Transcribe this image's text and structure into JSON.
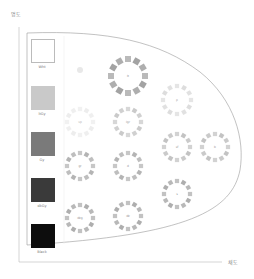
{
  "axes": {
    "y_label": "명도",
    "x_label": "채도"
  },
  "swatches": [
    {
      "label": "Wht",
      "color": "#ffffff",
      "border": "#bbbbbb",
      "top": 39
    },
    {
      "label": "ltGy",
      "color": "#c9c9c9",
      "border": "#c9c9c9",
      "top": 86
    },
    {
      "label": "Gy",
      "color": "#7a7a7a",
      "border": "#7a7a7a",
      "top": 132
    },
    {
      "label": "dkGy",
      "color": "#3a3a3a",
      "border": "#3a3a3a",
      "top": 178
    },
    {
      "label": "Black",
      "color": "#0d0d0d",
      "border": "#0d0d0d",
      "top": 224
    }
  ],
  "tone_rings": [
    {
      "label": "ltgy",
      "cx": 80,
      "cy": 70,
      "r": 3,
      "shade": "#d8d8d8",
      "opacity": 0.6
    },
    {
      "label": "lt",
      "cx": 128,
      "cy": 76,
      "r": 17,
      "shade": "#9a9a9a",
      "opacity": 0.9
    },
    {
      "label": "p",
      "cx": 177,
      "cy": 100,
      "r": 14,
      "shade": "#cfcfcf",
      "opacity": 0.7
    },
    {
      "label": "vp",
      "cx": 80,
      "cy": 122,
      "r": 13,
      "shade": "#e2e2e2",
      "opacity": 0.6
    },
    {
      "label": "lgr",
      "cx": 128,
      "cy": 122,
      "r": 13,
      "shade": "#bdbdbd",
      "opacity": 0.8
    },
    {
      "label": "sf",
      "cx": 177,
      "cy": 147,
      "r": 13,
      "shade": "#b5b5b5",
      "opacity": 0.8
    },
    {
      "label": "b",
      "cx": 215,
      "cy": 147,
      "r": 13,
      "shade": "#b5b5b5",
      "opacity": 0.8
    },
    {
      "label": "gr",
      "cx": 80,
      "cy": 166,
      "r": 13,
      "shade": "#a8a8a8",
      "opacity": 0.85
    },
    {
      "label": "d",
      "cx": 128,
      "cy": 166,
      "r": 13,
      "shade": "#a8a8a8",
      "opacity": 0.85
    },
    {
      "label": "s",
      "cx": 177,
      "cy": 194,
      "r": 13,
      "shade": "#a0a0a0",
      "opacity": 0.85
    },
    {
      "label": "dkg",
      "cx": 80,
      "cy": 218,
      "r": 13,
      "shade": "#a0a0a0",
      "opacity": 0.85
    },
    {
      "label": "dk",
      "cx": 128,
      "cy": 216,
      "r": 13,
      "shade": "#a0a0a0",
      "opacity": 0.85
    }
  ]
}
